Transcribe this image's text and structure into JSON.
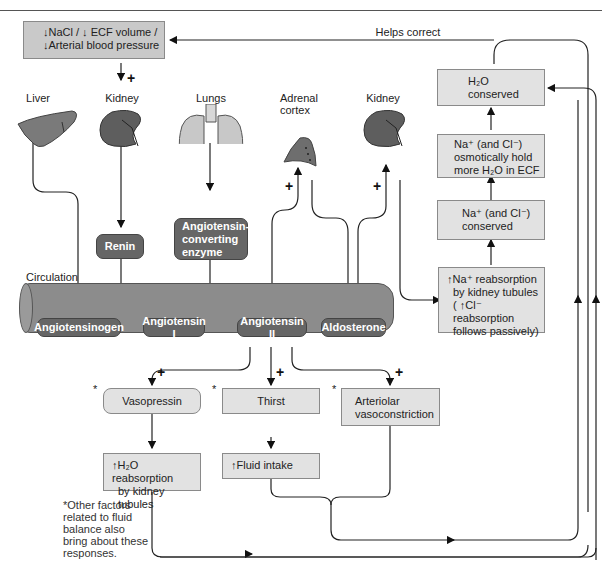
{
  "top_rule": true,
  "stimulus_box": {
    "line1": "↓NaCl / ↓ ECF volume /",
    "line2": "↓Arterial blood pressure"
  },
  "helps_correct_label": "Helps correct",
  "organs": {
    "liver": "Liver",
    "kidney1": "Kidney",
    "lungs": "Lungs",
    "adrenal_line1": "Adrenal",
    "adrenal_line2": "cortex",
    "kidney2": "Kidney"
  },
  "enzymes": {
    "renin": "Renin",
    "ace_line1": "Angiotensin-",
    "ace_line2": "converting",
    "ace_line3": "enzyme"
  },
  "circulation": {
    "label": "Circulation",
    "angiotensinogen": "Angiotensinogen",
    "angiotensin1": "Angiotensin I",
    "angiotensin2": "Angiotensin II",
    "aldosterone": "Aldosterone"
  },
  "right_column": {
    "h2o_conserved_line1": "H₂O",
    "h2o_conserved_line2": "conserved",
    "osmotic_line1": "Na⁺ (and Cl⁻)",
    "osmotic_line2": "osmotically hold",
    "osmotic_line3": "more H₂O in ECF",
    "na_conserved_line1": "Na⁺ (and Cl⁻)",
    "na_conserved_line2": "conserved",
    "reabs_line1": "↑Na⁺ reabsorption",
    "reabs_line2": "by kidney tubules",
    "reabs_line3": "( ↑Cl⁻ reabsorption",
    "reabs_line4": "follows passively)"
  },
  "responses": {
    "vasopressin": "Vasopressin",
    "thirst": "Thirst",
    "arteriolar_line1": "Arteriolar",
    "arteriolar_line2": "vasoconstriction",
    "h2o_reabs_line1": "↑H₂O reabsorption",
    "h2o_reabs_line2": "by kidney tubules",
    "fluid_intake": "↑Fluid intake"
  },
  "symbols": {
    "plus": "+",
    "star": "*"
  },
  "footnote": {
    "line1": "*Other factors",
    "line2": "related to fluid",
    "line3": "balance also",
    "line4": "bring about these",
    "line5": "responses."
  },
  "colors": {
    "box_fill": "#e2e2e2",
    "pill_fill": "#666666",
    "cylinder_fill": "#8c8c8c",
    "kidney": "#5e5e5e",
    "liver": "#7a7a7a",
    "lungs": "#c8c8c8"
  }
}
